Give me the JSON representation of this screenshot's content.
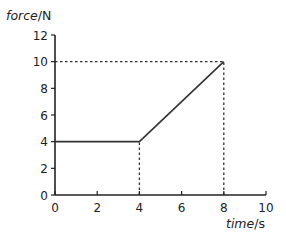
{
  "chart_data": {
    "type": "line",
    "title": "",
    "xlabel": "time/s",
    "ylabel": "force/N",
    "xlabel_parts": {
      "quantity": "time",
      "unit": "s"
    },
    "ylabel_parts": {
      "quantity": "force",
      "unit": "N"
    },
    "xlim": [
      0,
      10
    ],
    "ylim": [
      0,
      12
    ],
    "x_ticks": [
      0,
      2,
      4,
      6,
      8,
      10
    ],
    "y_ticks": [
      0,
      2,
      4,
      6,
      8,
      10,
      12
    ],
    "grid": false,
    "legend": null,
    "series": [
      {
        "name": "force",
        "x": [
          0,
          4,
          8
        ],
        "y": [
          4,
          4,
          10
        ],
        "style": "solid",
        "color": "#333333"
      }
    ],
    "reference_lines": [
      {
        "style": "dotted",
        "from": [
          4,
          0
        ],
        "to": [
          4,
          4
        ]
      },
      {
        "style": "dotted",
        "from": [
          8,
          0
        ],
        "to": [
          8,
          10
        ]
      },
      {
        "style": "dotted",
        "from": [
          0,
          10
        ],
        "to": [
          8,
          10
        ]
      }
    ]
  },
  "colors": {
    "axis": "#222222",
    "line": "#333333",
    "background": "#ffffff"
  }
}
